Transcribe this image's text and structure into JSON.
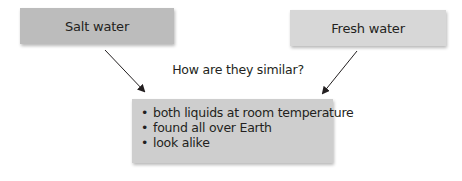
{
  "diagram": {
    "type": "compare-similarity",
    "nodes": {
      "salt_water": {
        "label": "Salt water",
        "color": "#bcbcbc"
      },
      "fresh_water": {
        "label": "Fresh water",
        "color": "#d7d7d7"
      }
    },
    "question": "How are they similar?",
    "similarities": {
      "color": "#cecece",
      "bullet": "•",
      "items": [
        "both liquids at room temperature",
        "found all over Earth",
        "look alike"
      ]
    },
    "arrows": [
      {
        "from": "salt_water",
        "to": "similarities"
      },
      {
        "from": "fresh_water",
        "to": "similarities"
      }
    ]
  }
}
